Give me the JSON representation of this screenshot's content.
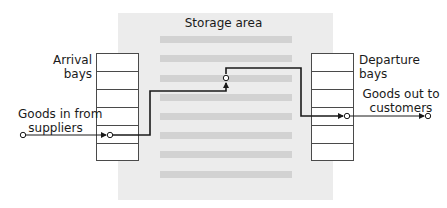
{
  "storage": {
    "title": "Storage area",
    "stripe_count": 8,
    "colors": {
      "area": "#ececec",
      "stripe": "#d2d2d2"
    }
  },
  "arrival": {
    "label_line1": "Arrival",
    "label_line2": "bays",
    "bay_count": 6
  },
  "departure": {
    "label_line1": "Departure",
    "label_line2": "bays",
    "bay_count": 6
  },
  "goods_in": {
    "label_line1": "Goods in from",
    "label_line2": "suppliers"
  },
  "goods_out": {
    "label_line1": "Goods out to",
    "label_line2": "customers"
  },
  "flow": {
    "color": "#1a1a1a",
    "description": "Goods flow from suppliers into arrival bays, through storage area, to departure bays and out to customers"
  }
}
